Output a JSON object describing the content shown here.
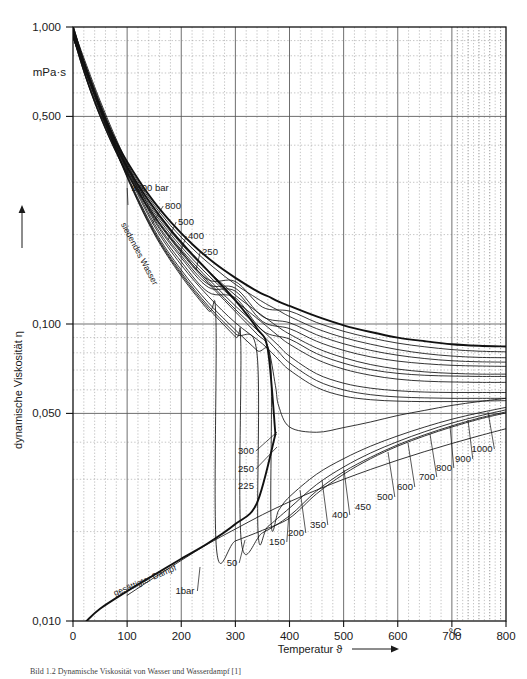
{
  "figure": {
    "title_unit": "mPa·s",
    "y_axis_title": "dynamische Viskosität η",
    "x_axis_title": "Temperatur ϑ",
    "x_unit": "°C",
    "caption": "Bild 1.2   Dynamische Viskosität von Wasser und Wasserdampf [1]"
  },
  "chart_data": {
    "type": "line",
    "title": "Dynamische Viskosität von Wasser und Wasserdampf",
    "xlabel": "Temperatur ϑ",
    "ylabel": "dynamische Viskosität η",
    "x_unit": "°C",
    "y_unit": "mPa·s",
    "xlim": [
      0,
      800
    ],
    "ylim": [
      0.01,
      1.0
    ],
    "yscale": "log",
    "xscale": "linear",
    "grid": true,
    "grid_major_x_step": 100,
    "grid_minor_x_step": 20,
    "legend": "inline-curve-labels",
    "x_ticks": [
      0,
      100,
      200,
      300,
      400,
      500,
      600,
      700,
      800
    ],
    "x_tick_labels": [
      "0",
      "100",
      "200",
      "300",
      "400",
      "500",
      "600",
      "700",
      "800"
    ],
    "y_ticks": [
      1.0,
      0.5,
      0.1,
      0.05,
      0.01
    ],
    "y_tick_labels": [
      "1,000",
      "0,500",
      "0,100",
      "0,050",
      "0,010"
    ],
    "annotations": [
      {
        "text": "siedendes Wasser",
        "kind": "region",
        "rotated": true
      },
      {
        "text": "gesättigter Dampf",
        "kind": "region",
        "rotated": true
      }
    ],
    "series": [
      {
        "name": "1000 bar",
        "pressure_bar": 1000,
        "label": "1000 bar",
        "x": [
          0,
          20,
          40,
          60,
          80,
          100,
          140,
          180,
          220,
          260,
          300,
          340,
          360,
          380,
          400,
          450,
          500,
          550,
          600,
          650,
          700,
          750,
          800
        ],
        "y": [
          1.0,
          0.76,
          0.6,
          0.49,
          0.41,
          0.352,
          0.272,
          0.221,
          0.186,
          0.161,
          0.143,
          0.129,
          0.124,
          0.119,
          0.115,
          0.106,
          0.099,
          0.094,
          0.09,
          0.0875,
          0.0855,
          0.0845,
          0.084
        ]
      },
      {
        "name": "800 bar",
        "pressure_bar": 800,
        "label": "800",
        "x": [
          0,
          20,
          40,
          60,
          80,
          100,
          140,
          180,
          220,
          260,
          300,
          340,
          360,
          380,
          400,
          450,
          500,
          550,
          600,
          650,
          700,
          750,
          800
        ],
        "y": [
          0.98,
          0.745,
          0.588,
          0.48,
          0.402,
          0.345,
          0.266,
          0.215,
          0.18,
          0.155,
          0.136,
          0.122,
          0.116,
          0.111,
          0.106,
          0.0965,
          0.09,
          0.0855,
          0.082,
          0.0795,
          0.078,
          0.0772,
          0.077
        ]
      },
      {
        "name": "500 bar",
        "pressure_bar": 500,
        "label": "500",
        "x": [
          0,
          20,
          40,
          60,
          80,
          100,
          140,
          180,
          220,
          260,
          300,
          340,
          360,
          380,
          400,
          450,
          500,
          550,
          600,
          650,
          700,
          750,
          800
        ],
        "y": [
          0.955,
          0.725,
          0.572,
          0.466,
          0.389,
          0.333,
          0.255,
          0.205,
          0.17,
          0.145,
          0.125,
          0.11,
          0.1035,
          0.0975,
          0.0925,
          0.083,
          0.077,
          0.073,
          0.0705,
          0.069,
          0.0682,
          0.0678,
          0.0678
        ]
      },
      {
        "name": "400 bar",
        "pressure_bar": 400,
        "label": "400",
        "x": [
          0,
          20,
          40,
          60,
          80,
          100,
          140,
          180,
          220,
          260,
          300,
          340,
          360,
          380,
          400,
          450,
          500,
          550,
          600,
          650,
          700,
          750,
          800
        ],
        "y": [
          0.945,
          0.718,
          0.566,
          0.461,
          0.384,
          0.328,
          0.251,
          0.201,
          0.166,
          0.14,
          0.12,
          0.1045,
          0.0975,
          0.091,
          0.0855,
          0.076,
          0.0705,
          0.0672,
          0.0652,
          0.0642,
          0.0638,
          0.0636,
          0.0636
        ]
      },
      {
        "name": "250 bar",
        "pressure_bar": 250,
        "label": "250",
        "x": [
          0,
          20,
          40,
          60,
          80,
          100,
          140,
          180,
          220,
          260,
          300,
          340,
          360,
          380,
          400,
          450,
          500,
          550,
          600,
          650,
          700,
          750,
          800
        ],
        "y": [
          0.932,
          0.708,
          0.558,
          0.454,
          0.378,
          0.322,
          0.245,
          0.195,
          0.159,
          0.133,
          0.112,
          0.0955,
          0.088,
          0.0805,
          0.074,
          0.0645,
          0.06,
          0.0578,
          0.0568,
          0.0564,
          0.0562,
          0.0562,
          0.0562
        ]
      },
      {
        "name": "300 bar",
        "pressure_bar": 300,
        "label": "300",
        "x": [
          0,
          20,
          40,
          60,
          80,
          100,
          140,
          180,
          220,
          260,
          300,
          340,
          360,
          380,
          400,
          450,
          500,
          550,
          600,
          650,
          700,
          750,
          800
        ],
        "y": [
          0.936,
          0.712,
          0.561,
          0.457,
          0.38,
          0.324,
          0.247,
          0.197,
          0.162,
          0.136,
          0.115,
          0.099,
          0.0915,
          0.0845,
          0.078,
          0.068,
          0.0632,
          0.0608,
          0.0596,
          0.059,
          0.0588,
          0.0588,
          0.0588
        ]
      },
      {
        "name": "225 bar",
        "pressure_bar": 225,
        "label": "225",
        "x": [
          0,
          20,
          40,
          60,
          80,
          100,
          140,
          180,
          220,
          260,
          300,
          340,
          360,
          374,
          380,
          400,
          450,
          500,
          550,
          600,
          650,
          700,
          750,
          800
        ],
        "y": [
          0.93,
          0.706,
          0.556,
          0.452,
          0.376,
          0.32,
          0.243,
          0.193,
          0.157,
          0.131,
          0.11,
          0.0925,
          0.084,
          0.062,
          0.053,
          0.045,
          0.0432,
          0.0448,
          0.0468,
          0.0492,
          0.0512,
          0.0532,
          0.0548,
          0.0562
        ]
      },
      {
        "name": "200 bar",
        "pressure_bar": 200,
        "label": "200",
        "x": [
          0,
          50,
          100,
          150,
          200,
          250,
          300,
          340,
          365,
          366,
          380,
          400,
          450,
          500,
          550,
          600,
          650,
          700,
          750,
          800
        ],
        "y": [
          0.928,
          0.533,
          0.318,
          0.208,
          0.152,
          0.118,
          0.0955,
          0.0815,
          0.074,
          0.0215,
          0.0236,
          0.0262,
          0.0312,
          0.0352,
          0.0388,
          0.042,
          0.045,
          0.0478,
          0.0502,
          0.0524
        ]
      },
      {
        "name": "150 bar",
        "pressure_bar": 150,
        "label": "150",
        "x": [
          0,
          50,
          100,
          150,
          200,
          250,
          300,
          340,
          342,
          360,
          400,
          450,
          500,
          550,
          600,
          650,
          700,
          750,
          800
        ],
        "y": [
          0.925,
          0.53,
          0.315,
          0.205,
          0.149,
          0.115,
          0.0928,
          0.0795,
          0.0198,
          0.0208,
          0.024,
          0.0288,
          0.033,
          0.0368,
          0.0402,
          0.0434,
          0.0464,
          0.049,
          0.0514
        ]
      },
      {
        "name": "100 bar",
        "pressure_bar": 100,
        "label": "100",
        "x": [
          0,
          50,
          100,
          150,
          200,
          250,
          300,
          310,
          311,
          350,
          400,
          450,
          500,
          550,
          600,
          650,
          700,
          750,
          800
        ],
        "y": [
          0.922,
          0.528,
          0.313,
          0.203,
          0.147,
          0.113,
          0.0905,
          0.0862,
          0.0185,
          0.0198,
          0.0226,
          0.0274,
          0.0318,
          0.0356,
          0.0392,
          0.0424,
          0.0454,
          0.0482,
          0.0506
        ]
      },
      {
        "name": "50 bar",
        "pressure_bar": 50,
        "label": "50",
        "x": [
          0,
          50,
          100,
          150,
          200,
          250,
          264,
          265,
          300,
          350,
          400,
          450,
          500,
          550,
          600,
          650,
          700,
          750,
          800
        ],
        "y": [
          0.92,
          0.526,
          0.311,
          0.201,
          0.145,
          0.111,
          0.1042,
          0.0176,
          0.0186,
          0.0202,
          0.0222,
          0.0268,
          0.0312,
          0.0352,
          0.0388,
          0.042,
          0.045,
          0.0478,
          0.0502
        ]
      },
      {
        "name": "350 bar",
        "pressure_bar": 350,
        "label": "350",
        "x": [
          0,
          50,
          100,
          150,
          200,
          250,
          300,
          350,
          380,
          400,
          450,
          500,
          550,
          600,
          650,
          700,
          750,
          800
        ],
        "y": [
          0.94,
          0.538,
          0.326,
          0.214,
          0.158,
          0.124,
          0.101,
          0.0858,
          0.0758,
          0.07,
          0.0612,
          0.0572,
          0.0556,
          0.055,
          0.0548,
          0.0548,
          0.055,
          0.0552
        ]
      },
      {
        "name": "450 bar",
        "pressure_bar": 450,
        "label": "450",
        "x": [
          0,
          50,
          100,
          150,
          200,
          250,
          300,
          350,
          400,
          450,
          500,
          550,
          600,
          650,
          700,
          750,
          800
        ],
        "y": [
          0.95,
          0.543,
          0.331,
          0.218,
          0.162,
          0.128,
          0.1225,
          0.095,
          0.089,
          0.0795,
          0.0738,
          0.0702,
          0.0682,
          0.0672,
          0.0668,
          0.0666,
          0.0666
        ]
      },
      {
        "name": "600 bar",
        "pressure_bar": 600,
        "label": "600",
        "x": [
          0,
          50,
          100,
          150,
          200,
          250,
          300,
          350,
          400,
          450,
          500,
          550,
          600,
          650,
          700,
          750,
          800
        ],
        "y": [
          0.962,
          0.55,
          0.337,
          0.223,
          0.167,
          0.133,
          0.129,
          0.102,
          0.0965,
          0.0875,
          0.0815,
          0.0775,
          0.075,
          0.0735,
          0.0726,
          0.0722,
          0.072
        ]
      },
      {
        "name": "700 bar",
        "pressure_bar": 700,
        "label": "700",
        "x": [
          0,
          50,
          100,
          150,
          200,
          250,
          300,
          350,
          400,
          450,
          500,
          550,
          600,
          650,
          700,
          750,
          800
        ],
        "y": [
          0.97,
          0.555,
          0.341,
          0.226,
          0.17,
          0.136,
          0.132,
          0.106,
          0.101,
          0.092,
          0.0858,
          0.0815,
          0.0785,
          0.0765,
          0.0752,
          0.0746,
          0.0744
        ]
      },
      {
        "name": "900 bar",
        "pressure_bar": 900,
        "label": "900",
        "x": [
          0,
          50,
          100,
          150,
          200,
          250,
          300,
          350,
          400,
          450,
          500,
          550,
          600,
          650,
          700,
          750,
          800
        ],
        "y": [
          0.99,
          0.565,
          0.348,
          0.232,
          0.176,
          0.141,
          0.139,
          0.114,
          0.1105,
          0.1012,
          0.0945,
          0.0898,
          0.0862,
          0.0838,
          0.082,
          0.081,
          0.0806
        ]
      },
      {
        "name": "saturated-steam",
        "pressure_bar": null,
        "label": "gesättigter Dampf",
        "x": [
          25,
          50,
          100,
          150,
          200,
          250,
          300,
          340,
          374
        ],
        "y": [
          0.01,
          0.011,
          0.0126,
          0.0143,
          0.0162,
          0.0183,
          0.0212,
          0.025,
          0.0425
        ]
      },
      {
        "name": "boiling-water",
        "pressure_bar": null,
        "label": "siedendes Wasser",
        "x": [
          0,
          20,
          40,
          60,
          80,
          100,
          140,
          180,
          220,
          260,
          300,
          340,
          360,
          374
        ],
        "y": [
          1.0,
          0.75,
          0.59,
          0.475,
          0.395,
          0.338,
          0.26,
          0.208,
          0.172,
          0.144,
          0.12,
          0.0965,
          0.0818,
          0.0425
        ]
      },
      {
        "name": "1bar-steam",
        "pressure_bar": 1,
        "label": "1bar",
        "x": [
          100,
          150,
          200,
          250,
          300,
          350,
          400,
          450,
          500,
          550,
          600,
          650,
          700,
          750,
          800
        ],
        "y": [
          0.0122,
          0.014,
          0.016,
          0.0182,
          0.0204,
          0.0228,
          0.0252,
          0.0276,
          0.03,
          0.0324,
          0.0348,
          0.0372,
          0.0396,
          0.042,
          0.0444
        ]
      }
    ],
    "curve_labels": [
      {
        "text": "1000 bar",
        "x_px": 150,
        "y_px": 191
      },
      {
        "text": "800",
        "x_px": 173,
        "y_px": 209
      },
      {
        "text": "500",
        "x_px": 186,
        "y_px": 225
      },
      {
        "text": "400",
        "x_px": 196,
        "y_px": 239
      },
      {
        "text": "250",
        "x_px": 210,
        "y_px": 255
      },
      {
        "text": "300",
        "x_px": 246,
        "y_px": 454
      },
      {
        "text": "250",
        "x_px": 246,
        "y_px": 472
      },
      {
        "text": "225",
        "x_px": 246,
        "y_px": 489
      },
      {
        "text": "150",
        "x_px": 277,
        "y_px": 545
      },
      {
        "text": "200",
        "x_px": 296,
        "y_px": 536
      },
      {
        "text": "350",
        "x_px": 318,
        "y_px": 528
      },
      {
        "text": "400",
        "x_px": 340,
        "y_px": 518
      },
      {
        "text": "450",
        "x_px": 363,
        "y_px": 510
      },
      {
        "text": "500",
        "x_px": 385,
        "y_px": 500
      },
      {
        "text": "600",
        "x_px": 405,
        "y_px": 490
      },
      {
        "text": "700",
        "x_px": 427,
        "y_px": 480
      },
      {
        "text": "800",
        "x_px": 444,
        "y_px": 471
      },
      {
        "text": "900",
        "x_px": 463,
        "y_px": 462
      },
      {
        "text": "1000",
        "x_px": 482,
        "y_px": 452
      },
      {
        "text": "50",
        "x_px": 232,
        "y_px": 566
      },
      {
        "text": "1bar",
        "x_px": 185,
        "y_px": 594
      }
    ]
  }
}
